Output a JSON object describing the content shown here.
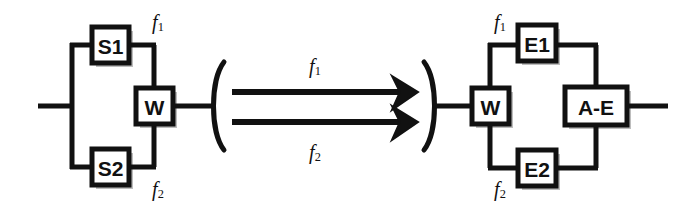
{
  "diagram": {
    "stroke_color": "#111111",
    "fill_color": "#ffffff",
    "shadow_color": "#b9b9b9",
    "background": "#ffffff",
    "line_width": 5,
    "box_line_width": 5,
    "blocks": [
      {
        "id": "s1",
        "label": "S1",
        "x": 92,
        "y": 27,
        "w": 37,
        "h": 36,
        "font_size": 21
      },
      {
        "id": "s2",
        "label": "S2",
        "x": 92,
        "y": 149,
        "w": 37,
        "h": 36,
        "font_size": 21
      },
      {
        "id": "w1",
        "label": "W",
        "x": 136,
        "y": 88,
        "w": 37,
        "h": 36,
        "font_size": 21
      },
      {
        "id": "w2",
        "label": "W",
        "x": 472,
        "y": 88,
        "w": 37,
        "h": 36,
        "font_size": 21
      },
      {
        "id": "e1",
        "label": "E1",
        "x": 518,
        "y": 25,
        "w": 38,
        "h": 36,
        "font_size": 21
      },
      {
        "id": "e2",
        "label": "E2",
        "x": 518,
        "y": 150,
        "w": 38,
        "h": 36,
        "font_size": 21
      },
      {
        "id": "ae",
        "label": "A-E",
        "x": 565,
        "y": 87,
        "w": 62,
        "h": 38,
        "font_size": 21
      }
    ],
    "channel_labels": [
      {
        "id": "left-f1",
        "base": "f",
        "sub": "1",
        "x": 158,
        "y": 22,
        "font_size": 20
      },
      {
        "id": "left-f2",
        "base": "f",
        "sub": "2",
        "x": 158,
        "y": 189,
        "font_size": 20
      },
      {
        "id": "link-f1",
        "base": "f",
        "sub": "1",
        "x": 315,
        "y": 66,
        "font_size": 20
      },
      {
        "id": "link-f2",
        "base": "f",
        "sub": "2",
        "x": 315,
        "y": 152,
        "font_size": 20
      },
      {
        "id": "right-f1",
        "base": "f",
        "sub": "1",
        "x": 500,
        "y": 22,
        "font_size": 20
      },
      {
        "id": "right-f2",
        "base": "f",
        "sub": "2",
        "x": 500,
        "y": 189,
        "font_size": 20
      }
    ],
    "link": {
      "open_paren": "(",
      "close_paren": ")",
      "arrow_count": 2,
      "arrow_top_y": 92,
      "arrow_bottom_y": 122,
      "arrow_start_x": 228,
      "arrow_end_x": 412
    },
    "terminals": {
      "input_label": "input",
      "output_label": "output"
    }
  }
}
